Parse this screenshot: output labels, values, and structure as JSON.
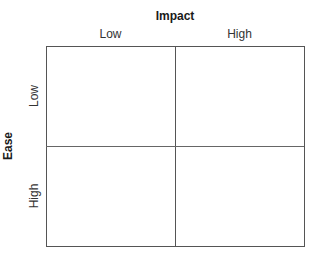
{
  "matrix": {
    "x_axis": {
      "title": "Impact",
      "labels": [
        "Low",
        "High"
      ]
    },
    "y_axis": {
      "title": "Ease",
      "labels": [
        "Low",
        "High"
      ]
    },
    "quadrants": [
      {
        "row": "Low",
        "col": "Low",
        "text": ""
      },
      {
        "row": "Low",
        "col": "High",
        "text": ""
      },
      {
        "row": "High",
        "col": "Low",
        "text": ""
      },
      {
        "row": "High",
        "col": "High",
        "text": ""
      }
    ]
  }
}
